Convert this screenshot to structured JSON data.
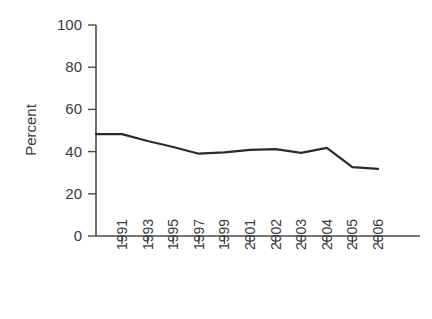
{
  "chart_data": {
    "type": "line",
    "title": "",
    "subtitle": "",
    "xlabel": "",
    "ylabel": "Percent",
    "categories": [
      "1991",
      "1993",
      "1995",
      "1997",
      "1999",
      "2001",
      "2002",
      "2003",
      "2004",
      "2005",
      "2006"
    ],
    "x_tick_labels": [
      "1991",
      "1993",
      "1995",
      "1997",
      "1999",
      "2001",
      "2002",
      "2003",
      "2004",
      "2005",
      "2006"
    ],
    "y_tick_labels": [
      "0",
      "20",
      "40",
      "60",
      "80",
      "100"
    ],
    "y_ticks": [
      0,
      20,
      40,
      60,
      80,
      100
    ],
    "ylim": [
      0,
      100
    ],
    "grid": false,
    "legend": null,
    "legend_position": "none",
    "series": [
      {
        "name": "Percent",
        "values": [
          48.3,
          45.0,
          42.2,
          39.0,
          39.6,
          40.8,
          41.2,
          39.4,
          41.8,
          32.6,
          31.8
        ]
      }
    ],
    "line_color": "#2b2b2b",
    "axis_color": "#4a4a4a",
    "background_color": "#ffffff",
    "annotations": []
  }
}
